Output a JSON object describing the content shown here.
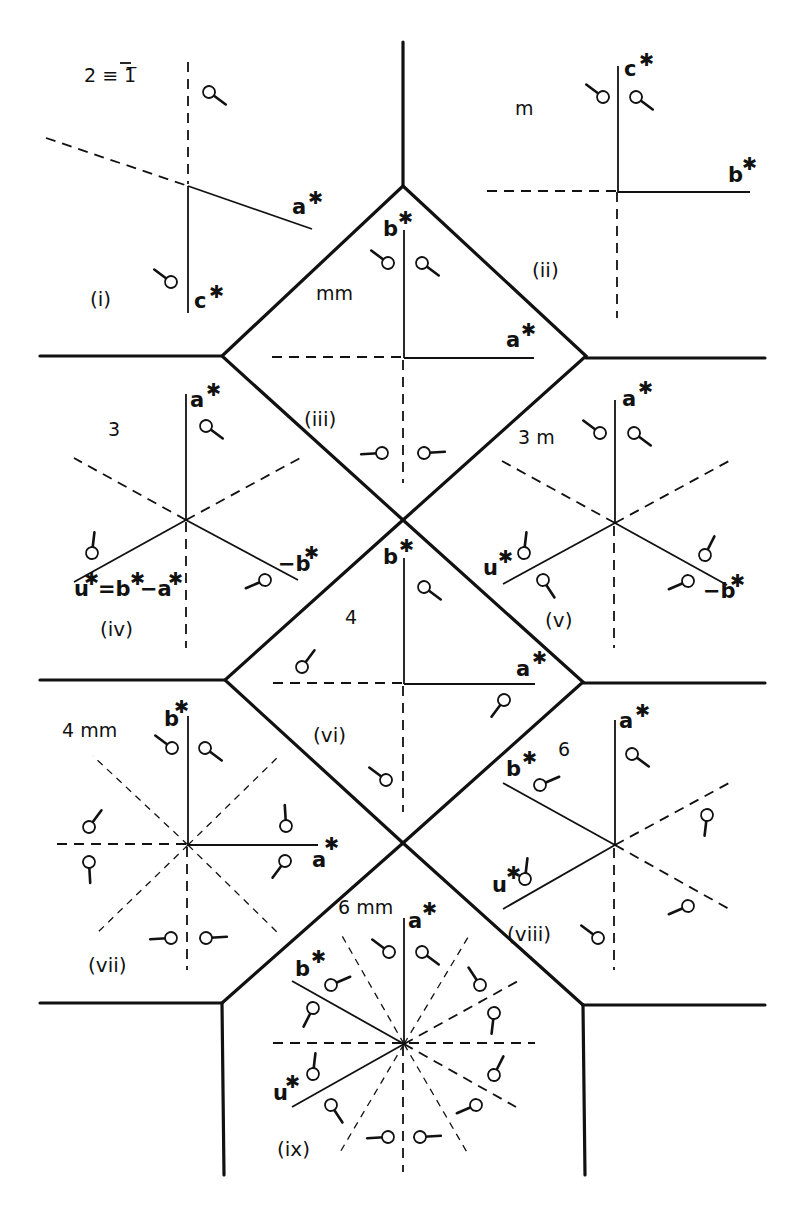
{
  "figure": {
    "panels": [
      {
        "id": "i",
        "label": "(i)",
        "symmetry": "2 ≡ 1̅",
        "axes": [
          "a*",
          "c*"
        ]
      },
      {
        "id": "ii",
        "label": "(ii)",
        "symmetry": "m",
        "axes": [
          "c*",
          "b*"
        ]
      },
      {
        "id": "iii",
        "label": "(iii)",
        "symmetry": "mm",
        "axes": [
          "b*",
          "a*"
        ]
      },
      {
        "id": "iv",
        "label": "(iv)",
        "symmetry": "3",
        "axes": [
          "a*",
          "-b*",
          "u* = b* - a*"
        ]
      },
      {
        "id": "v",
        "label": "(v)",
        "symmetry": "3 m",
        "axes": [
          "a*",
          "-b*",
          "u*"
        ]
      },
      {
        "id": "vi",
        "label": "(vi)",
        "symmetry": "4",
        "axes": [
          "b*",
          "a*"
        ]
      },
      {
        "id": "vii",
        "label": "(vii)",
        "symmetry": "4 mm",
        "axes": [
          "b*",
          "a*"
        ]
      },
      {
        "id": "viii",
        "label": "(viii)",
        "symmetry": "6",
        "axes": [
          "a*",
          "b*",
          "u*"
        ]
      },
      {
        "id": "ix",
        "label": "(ix)",
        "symmetry": "6 mm",
        "axes": [
          "a*",
          "b*",
          "u*"
        ]
      }
    ],
    "vector_letters": {
      "a": "a",
      "b": "b",
      "c": "c",
      "u": "u",
      "neg_b": "−b",
      "star": "✱",
      "u_eq": "=b",
      "u_minus": "−a"
    },
    "colors": {
      "ink": "#111111",
      "background": "#ffffff"
    }
  }
}
